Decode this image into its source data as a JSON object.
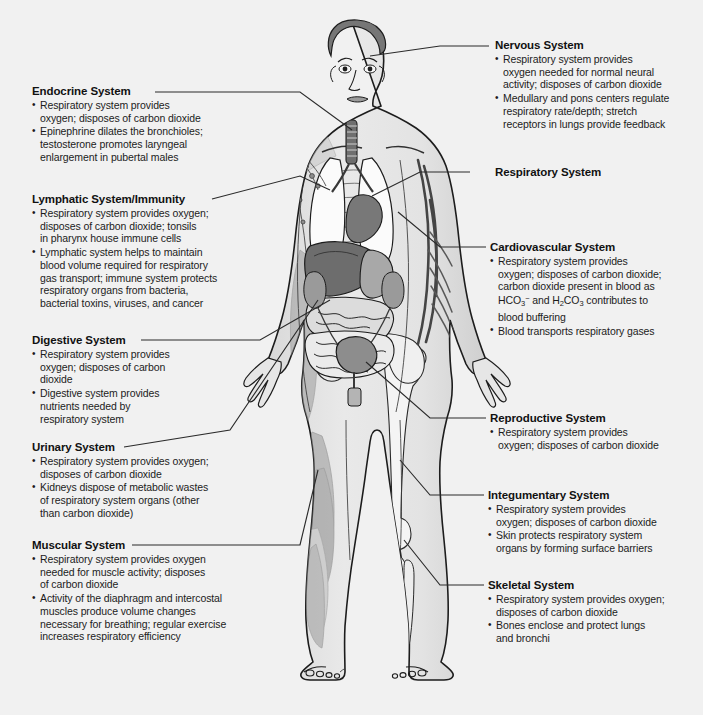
{
  "diagram": {
    "figure_label": "anterior-view-human-body-with-internal-organs",
    "background_color": "#f1f1f1",
    "text_color": "#1a1a1a",
    "leader_line_color": "#2b2b2b"
  },
  "callouts": [
    {
      "id": "endocrine",
      "title": "Endocrine System",
      "bullets": [
        [
          "Respiratory system provides",
          "oxygen; disposes of carbon dioxide"
        ],
        [
          "Epinephrine dilates the bronchioles;",
          "testosterone promotes laryngeal",
          "enlargement in pubertal males"
        ]
      ]
    },
    {
      "id": "lymphatic",
      "title": "Lymphatic System/Immunity",
      "bullets": [
        [
          "Respiratory system provides oxygen;",
          "disposes of carbon dioxide; tonsils",
          "in pharynx house immune cells"
        ],
        [
          "Lymphatic system helps to maintain",
          "blood volume required for respiratory",
          "gas transport; immune system protects",
          "respiratory organs from bacteria,",
          "bacterial toxins, viruses, and cancer"
        ]
      ]
    },
    {
      "id": "digestive",
      "title": "Digestive System",
      "bullets": [
        [
          "Respiratory system provides",
          "oxygen; disposes of carbon",
          "dioxide"
        ],
        [
          "Digestive system provides",
          "nutrients needed by",
          "respiratory system"
        ]
      ]
    },
    {
      "id": "urinary",
      "title": "Urinary System",
      "bullets": [
        [
          "Respiratory system provides oxygen;",
          "disposes of carbon dioxide"
        ],
        [
          "Kidneys dispose of metabolic wastes",
          "of respiratory system organs (other",
          "than carbon dioxide)"
        ]
      ]
    },
    {
      "id": "muscular",
      "title": "Muscular System",
      "bullets": [
        [
          "Respiratory system provides oxygen",
          "needed for muscle activity; disposes",
          "of carbon dioxide"
        ],
        [
          "Activity of the diaphragm and intercostal",
          "muscles produce volume changes",
          "necessary for breathing; regular exercise",
          "increases respiratory efficiency"
        ]
      ]
    },
    {
      "id": "nervous",
      "title": "Nervous System",
      "bullets": [
        [
          "Respiratory system provides",
          "oxygen needed for normal neural",
          "activity; disposes of carbon dioxide"
        ],
        [
          "Medullary and pons centers regulate",
          "respiratory rate/depth; stretch",
          "receptors in lungs provide feedback"
        ]
      ]
    },
    {
      "id": "respiratory",
      "title": "Respiratory System",
      "bullets": []
    },
    {
      "id": "cardiovascular",
      "title": "Cardiovascular System",
      "bullets": [
        [
          "Respiratory system provides",
          "oxygen; disposes of carbon dioxide;",
          "carbon dioxide present in blood as",
          "HCO3- and H2CO3 contributes to",
          "blood buffering"
        ],
        [
          "Blood transports respiratory gases"
        ]
      ],
      "formula_line": "HCO₃⁻ and H₂CO₃ contributes to"
    },
    {
      "id": "reproductive",
      "title": "Reproductive System",
      "bullets": [
        [
          "Respiratory system provides",
          "oxygen; disposes of carbon dioxide"
        ]
      ]
    },
    {
      "id": "integumentary",
      "title": "Integumentary System",
      "bullets": [
        [
          "Respiratory system provides",
          "oxygen; disposes of carbon dioxide"
        ],
        [
          "Skin protects respiratory system",
          "organs by forming surface barriers"
        ]
      ]
    },
    {
      "id": "skeletal",
      "title": "Skeletal System",
      "bullets": [
        [
          "Respiratory system provides oxygen;",
          "disposes of carbon dioxide"
        ],
        [
          "Bones enclose and protect lungs",
          "and bronchi"
        ]
      ]
    }
  ]
}
